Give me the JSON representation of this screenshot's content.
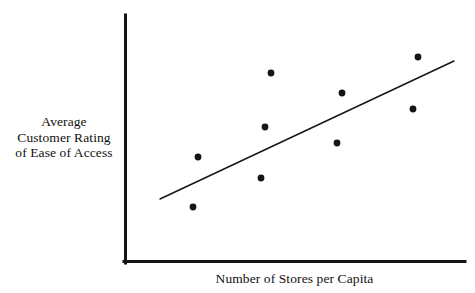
{
  "chart_data": {
    "type": "scatter",
    "title": "",
    "subtitle": "",
    "xlabel": "Number of Stores per Capita",
    "ylabel": "Average Customer Rating of Ease of Access",
    "ylabel_lines": [
      "Average",
      "Customer Rating",
      "of Ease of Access"
    ],
    "grid": false,
    "legend": "none",
    "axis_ticks": "none",
    "axis_tick_labels": [],
    "xlim": [
      0,
      10
    ],
    "ylim": [
      0,
      10
    ],
    "series": [
      {
        "name": "observations",
        "marker": "filled-circle",
        "color": "#141414",
        "points": [
          {
            "x": 1.45,
            "y": 2.25
          },
          {
            "x": 1.6,
            "y": 3.6
          },
          {
            "x": 3.55,
            "y": 4.45
          },
          {
            "x": 3.45,
            "y": 3.0
          },
          {
            "x": 3.75,
            "y": 6.45
          },
          {
            "x": 5.75,
            "y": 5.85
          },
          {
            "x": 5.6,
            "y": 4.45
          },
          {
            "x": 7.8,
            "y": 5.4
          },
          {
            "x": 7.95,
            "y": 6.9
          }
        ]
      }
    ],
    "trend_line": {
      "name": "fitted line",
      "color": "#141414",
      "x_start": 1.05,
      "y_start": 2.0,
      "x_end": 9.65,
      "y_end": 6.35,
      "slope_sign": "positive"
    },
    "colors": {
      "background": "#ffffff",
      "axis": "#141414",
      "marker": "#141414",
      "trend_line": "#141414",
      "text": "#111111"
    },
    "geometry": {
      "axis_origin_x": 124,
      "axis_origin_y": 263,
      "axis_top_y": 15,
      "axis_right_x": 465,
      "axis_stroke_width": 3,
      "marker_radius": 3.4,
      "trend_stroke_width": 1.4,
      "pixel_points": [
        {
          "cx": 193,
          "cy": 207
        },
        {
          "cx": 198,
          "cy": 157
        },
        {
          "cx": 265,
          "cy": 127
        },
        {
          "cx": 261,
          "cy": 178
        },
        {
          "cx": 271,
          "cy": 73
        },
        {
          "cx": 342,
          "cy": 93
        },
        {
          "cx": 337,
          "cy": 143
        },
        {
          "cx": 413,
          "cy": 109
        },
        {
          "cx": 418,
          "cy": 57
        }
      ],
      "trend_pixels": {
        "x1": 160,
        "y1": 199,
        "x2": 454,
        "y2": 61
      }
    }
  },
  "figure": {
    "y_label_lines": {
      "line1": "Average",
      "line2": "Customer Rating",
      "line3": "of Ease of Access"
    },
    "x_label": "Number of Stores per Capita"
  }
}
